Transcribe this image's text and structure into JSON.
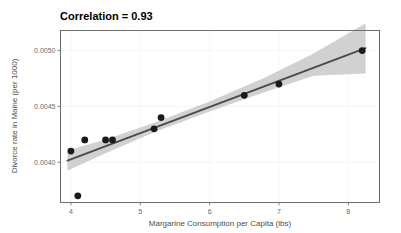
{
  "chart_data": {
    "type": "scatter",
    "title": "Correlation = 0.93",
    "xlabel": "Margarine Consumption per Capita (lbs)",
    "ylabel": "Divorce rate in Maine (per 1000)",
    "xlim": [
      3.85,
      8.45
    ],
    "ylim": [
      0.00364,
      0.00518
    ],
    "xticks": [
      4,
      5,
      6,
      7,
      8
    ],
    "xticklabels": [
      "4",
      "5",
      "6",
      "7",
      "8"
    ],
    "yticks": [
      0.004,
      0.0045,
      0.005
    ],
    "yticklabels": [
      "0.0040",
      "0.0045",
      "0.0050"
    ],
    "grid": false,
    "legend": "none",
    "series": [
      {
        "name": "observations",
        "marker": "filled-circle",
        "color": "#1a1a1a",
        "x": [
          4.0,
          4.1,
          4.2,
          4.5,
          4.6,
          5.2,
          5.3,
          6.5,
          7.0,
          8.2
        ],
        "y": [
          0.0041,
          0.0037,
          0.0042,
          0.0042,
          0.0042,
          0.0043,
          0.0044,
          0.0046,
          0.0047,
          0.005
        ]
      }
    ],
    "regression": {
      "name": "linear-fit",
      "color": "#4a4a4a",
      "x": [
        3.95,
        8.25
      ],
      "y": [
        0.004015,
        0.005022
      ],
      "slope": 0.000234,
      "intercept": 0.003091
    },
    "confidence_band": {
      "name": "95% confidence interval",
      "color": "#c9c9c9",
      "x": [
        3.95,
        4.5,
        5.2,
        6.0,
        6.8,
        7.5,
        8.25
      ],
      "upper": [
        0.004105,
        0.004205,
        0.004355,
        0.004545,
        0.00476,
        0.004975,
        0.005245
      ],
      "lower": [
        0.003925,
        0.00408,
        0.00427,
        0.004455,
        0.00463,
        0.004775,
        0.004795
      ]
    }
  },
  "axis": {
    "x_title": "Margarine Consumption per Capita (lbs)",
    "y_title": "Divorce rate in Maine (per 1000)"
  },
  "title": {
    "text": "Correlation = 0.93"
  },
  "ticks": {
    "x": [
      "4",
      "5",
      "6",
      "7",
      "8"
    ],
    "y": [
      "0.0050",
      "0.0045",
      "0.0040"
    ]
  }
}
